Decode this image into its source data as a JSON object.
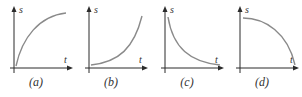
{
  "figure": {
    "y_axis_label": "s",
    "x_axis_label": "t",
    "panels": [
      {
        "id": "a",
        "caption": "(a)",
        "shape": "increasing-concave-down"
      },
      {
        "id": "b",
        "caption": "(b)",
        "shape": "increasing-concave-up"
      },
      {
        "id": "c",
        "caption": "(c)",
        "shape": "decreasing-concave-up"
      },
      {
        "id": "d",
        "caption": "(d)",
        "shape": "decreasing-concave-down"
      }
    ]
  },
  "colors": {
    "axis": "#2b2b2b",
    "curve": "#8a8a8a"
  }
}
